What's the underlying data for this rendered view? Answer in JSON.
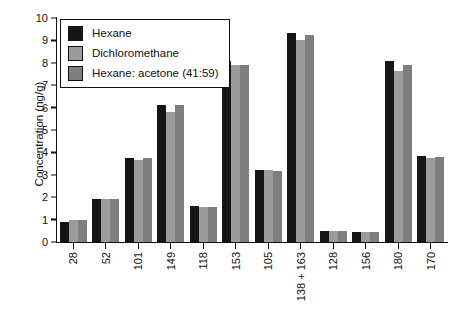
{
  "chart_data": {
    "type": "bar",
    "title": "",
    "subtitle": "",
    "xlabel": "",
    "ylabel": "Concentration (ng/g)",
    "ylim": [
      0,
      10
    ],
    "ytick_labels": [
      "10",
      "9",
      "8",
      "7",
      "6",
      "5",
      "4",
      "3",
      "2",
      "1",
      "0"
    ],
    "ytick_values": [
      10,
      9,
      8,
      7,
      6,
      5,
      4,
      3,
      2,
      1,
      0
    ],
    "grid": false,
    "legend_position": "upper-left",
    "categories": [
      "28",
      "52",
      "101",
      "149",
      "118",
      "153",
      "105",
      "138 + 163",
      "128",
      "156",
      "180",
      "170"
    ],
    "series": [
      {
        "name": "Hexane",
        "color": "#151515",
        "values": [
          0.9,
          1.9,
          3.75,
          6.1,
          1.6,
          8.1,
          3.2,
          9.35,
          0.5,
          0.45,
          8.1,
          3.85
        ]
      },
      {
        "name": "Dichloromethane",
        "color": "#9b9b9b",
        "values": [
          1.0,
          1.9,
          3.65,
          5.8,
          1.55,
          7.9,
          3.2,
          9.0,
          0.5,
          0.45,
          7.65,
          3.75
        ]
      },
      {
        "name": "Hexane: acetone (41:59)",
        "color": "#7e7e7e",
        "values": [
          1.0,
          1.9,
          3.75,
          6.1,
          1.55,
          7.9,
          3.15,
          9.25,
          0.5,
          0.45,
          7.9,
          3.8
        ]
      }
    ]
  },
  "legend": {
    "items": [
      {
        "label": "Hexane",
        "swatch": "series-0-swatch"
      },
      {
        "label": "Dichloromethane",
        "swatch": "series-1-swatch"
      },
      {
        "label": "Hexane: acetone (41:59)",
        "swatch": "series-2-swatch"
      }
    ]
  },
  "colors": {
    "series_0": "#151515",
    "series_1": "#9b9b9b",
    "series_2": "#7e7e7e",
    "axis": "#111111",
    "background": "#ffffff"
  }
}
